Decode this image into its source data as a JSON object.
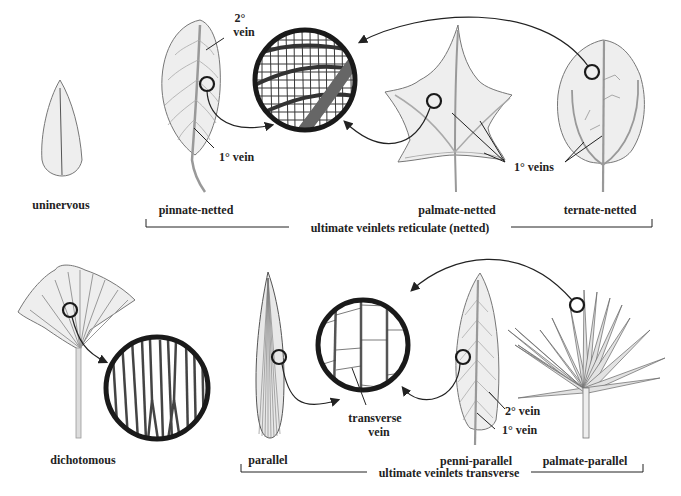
{
  "rows": [
    {
      "group_label": "ultimate veinlets reticulate (netted)",
      "types": [
        "unipinnate"
      ]
    }
  ],
  "labels": {
    "uninervous": "uninervous",
    "pinnate_netted": "pinnate-netted",
    "palmate_netted": "palmate-netted",
    "ternate_netted": "ternate-netted",
    "reticulate_group": "ultimate veinlets reticulate (netted)",
    "dichotomous": "dichotomous",
    "parallel": "parallel",
    "penni_parallel": "penni-parallel",
    "palmate_parallel": "palmate-parallel",
    "transverse_group": "ultimate veinlets transverse"
  },
  "annotations": {
    "secondary_vein_top_1": "2°",
    "secondary_vein_top_2": "vein",
    "primary_vein_pinnate": "1° vein",
    "primary_veins": "1° veins",
    "transverse_vein_1": "transverse",
    "transverse_vein_2": "vein",
    "secondary_vein_penni": "2° vein",
    "primary_vein_penni": "1° vein"
  },
  "colors": {
    "leaf_fill": "#eeeeee",
    "leaf_stroke": "#777777",
    "vein": "#8a8a8a",
    "circle": "#1a1a1a",
    "text": "#222222"
  }
}
